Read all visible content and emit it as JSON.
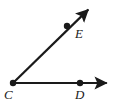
{
  "figure": {
    "kind": "geometry-angle-diagram",
    "background_color": "#ffffff",
    "stroke_color": "#1a1a1a",
    "stroke_width": 2,
    "width": 119,
    "height": 105
  },
  "labels": {
    "vertex": "C",
    "horizontal_point": "D",
    "diagonal_point": "E"
  },
  "points": [
    {
      "name": "C",
      "role": "vertex",
      "x": 13,
      "y": 83,
      "dot_radius": 3.2,
      "label": "C",
      "label_x": 4,
      "label_y": 88
    },
    {
      "name": "D",
      "role": "ray-point",
      "x": 80,
      "y": 83,
      "dot_radius": 3.2,
      "label": "D",
      "label_x": 75,
      "label_y": 88
    },
    {
      "name": "E",
      "role": "ray-point",
      "x": 67,
      "y": 26,
      "dot_radius": 3.2,
      "label": "E",
      "label_x": 75,
      "label_y": 27
    }
  ],
  "rays": [
    {
      "name": "ray-CD",
      "from": "C",
      "through": "D",
      "start_x": 13,
      "start_y": 83,
      "end_x": 112,
      "end_y": 83,
      "arrowhead": "end",
      "direction": "east"
    },
    {
      "name": "ray-CE",
      "from": "C",
      "through": "E",
      "start_x": 13,
      "start_y": 83,
      "end_x": 92,
      "end_y": 6,
      "arrowhead": "end",
      "direction": "northeast"
    }
  ]
}
